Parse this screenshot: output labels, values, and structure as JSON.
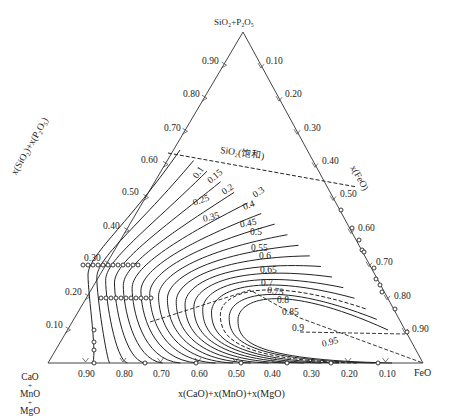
{
  "diagram": {
    "type": "ternary",
    "vertices": {
      "top": "SiO₂+P₂O₅",
      "left": [
        "CaO",
        "+",
        "MnO",
        "+",
        "MgO"
      ],
      "right": "FeO"
    },
    "axis_titles": {
      "left": "x(SiO₂)+x(P₂O₅)",
      "right": "x(FeO)",
      "bottom": "x(CaO)+x(MnO)+x(MgO)"
    },
    "ticks": {
      "left": [
        "0.10",
        "0.20",
        "0.30",
        "0.40",
        "0.50",
        "0.60",
        "0.70",
        "0.80",
        "0.90"
      ],
      "right": [
        "0.10",
        "0.20",
        "0.30",
        "0.40",
        "0.50",
        "0.60",
        "0.70",
        "0.80",
        "0.90"
      ],
      "bottom": [
        "0.90",
        "0.80",
        "0.70",
        "0.60",
        "0.50",
        "0.40",
        "0.30",
        "0.20",
        "0.10"
      ]
    },
    "saturation_label": "SiO₂(饱和)",
    "contour_labels": [
      "0.1",
      "0.15",
      "0.2",
      "0.25",
      "0.3",
      "0.35",
      "0.4",
      "0.45",
      "0.5",
      "0.55",
      "0.6",
      "0.65",
      "0.7",
      "0.75",
      "0.8",
      "0.85",
      "0.9",
      "0.95"
    ],
    "colors": {
      "line": "#222222",
      "axis": "#444444",
      "background": "#ffffff"
    }
  }
}
